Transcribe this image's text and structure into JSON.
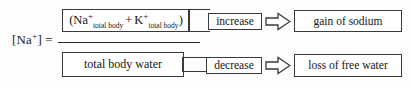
{
  "diagram": {
    "formula": {
      "label_prefix": "[Na",
      "label_charge": "+",
      "label_suffix": "] =",
      "numerator": {
        "open_paren": "(",
        "ion1": "Na",
        "ion1_charge": "+",
        "ion1_sub": "total body",
        "operator": "+",
        "ion2": "K",
        "ion2_charge": "+",
        "ion2_sub": "total body",
        "close_paren": ")"
      },
      "denominator": "total body water"
    },
    "numerator_change": "increase",
    "denominator_change": "decrease",
    "numerator_outcome": "gain of sodium",
    "denominator_outcome": "loss of free water",
    "arrow_icon": "block-arrow-right-icon",
    "colors": {
      "stroke": "#3a3a3a",
      "text": "#161616",
      "background": "#fdfdfd"
    }
  }
}
